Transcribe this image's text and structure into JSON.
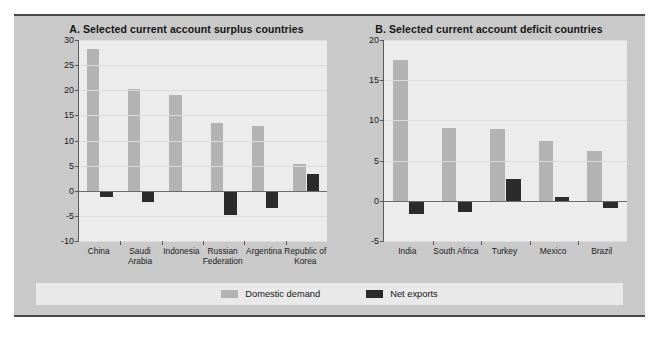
{
  "figure": {
    "background_color": "#c9c9c9",
    "plot_background_color": "#ececec"
  },
  "legend": {
    "entries": [
      {
        "label": "Domestic demand",
        "color": "#b3b3b3"
      },
      {
        "label": "Net exports",
        "color": "#2b2b2b"
      }
    ]
  },
  "chart_data": [
    {
      "type": "bar",
      "title": "A. Selected current account surplus countries",
      "panel": "A",
      "categories": [
        "China",
        "Saudi Arabia",
        "Indonesia",
        "Russian Federation",
        "Argentina",
        "Republic of Korea"
      ],
      "category_lines": [
        [
          "China"
        ],
        [
          "Saudi",
          "Arabia"
        ],
        [
          "Indonesia"
        ],
        [
          "Russian",
          "Federation"
        ],
        [
          "Argentina"
        ],
        [
          "Republic of",
          "Korea"
        ]
      ],
      "series": [
        {
          "name": "Domestic demand",
          "color": "#b3b3b3",
          "values": [
            28.3,
            20.3,
            19.0,
            13.4,
            12.9,
            5.3
          ]
        },
        {
          "name": "Net exports",
          "color": "#2b2b2b",
          "values": [
            -1.3,
            -2.2,
            -0.2,
            -4.8,
            -3.4,
            3.4
          ]
        }
      ],
      "xlabel": "",
      "ylabel": "",
      "ylim": [
        -10,
        30
      ],
      "yticks": [
        -10,
        -5,
        0,
        5,
        10,
        15,
        20,
        25,
        30
      ],
      "grid": true,
      "legend_position": "bottom"
    },
    {
      "type": "bar",
      "title": "B. Selected current account deficit countries",
      "panel": "B",
      "categories": [
        "India",
        "South Africa",
        "Turkey",
        "Mexico",
        "Brazil"
      ],
      "category_lines": [
        [
          "India"
        ],
        [
          "South Africa"
        ],
        [
          "Turkey"
        ],
        [
          "Mexico"
        ],
        [
          "Brazil"
        ]
      ],
      "series": [
        {
          "name": "Domestic demand",
          "color": "#b3b3b3",
          "values": [
            17.5,
            9.1,
            8.9,
            7.4,
            6.2
          ]
        },
        {
          "name": "Net exports",
          "color": "#2b2b2b",
          "values": [
            -1.6,
            -1.4,
            2.7,
            0.5,
            -0.9
          ]
        }
      ],
      "xlabel": "",
      "ylabel": "",
      "ylim": [
        -5,
        20
      ],
      "yticks": [
        -5,
        0,
        5,
        10,
        15,
        20
      ],
      "grid": true,
      "legend_position": "bottom"
    }
  ]
}
